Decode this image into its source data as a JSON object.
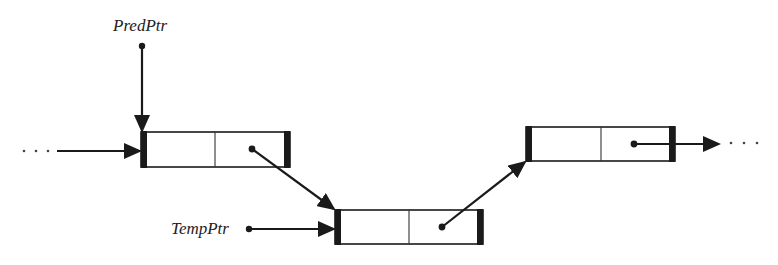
{
  "diagram": {
    "type": "linked-list",
    "labels": {
      "pred_ptr": "PredPtr",
      "temp_ptr": "TempPtr"
    },
    "ellipsis": "· · ·",
    "nodes": [
      {
        "id": "node-1",
        "x": 141,
        "y": 132,
        "w": 149,
        "h": 35,
        "divider_x": 215,
        "ptr_dot": [
          252,
          149
        ]
      },
      {
        "id": "node-2",
        "x": 335,
        "y": 210,
        "w": 148,
        "h": 34,
        "divider_x": 409,
        "ptr_dot": [
          442,
          227
        ]
      },
      {
        "id": "node-3",
        "x": 526,
        "y": 127,
        "w": 149,
        "h": 34,
        "divider_x": 601,
        "ptr_dot": [
          634,
          144
        ]
      }
    ],
    "edges": [
      {
        "from": "incoming",
        "to": "node-1"
      },
      {
        "from": "PredPtr",
        "to": "node-1"
      },
      {
        "from": "node-1",
        "to": "node-2"
      },
      {
        "from": "TempPtr",
        "to": "node-2"
      },
      {
        "from": "node-2",
        "to": "node-3"
      },
      {
        "from": "node-3",
        "to": "outgoing"
      }
    ],
    "colors": {
      "stroke": "#1a1a1a",
      "background": "#ffffff"
    }
  }
}
